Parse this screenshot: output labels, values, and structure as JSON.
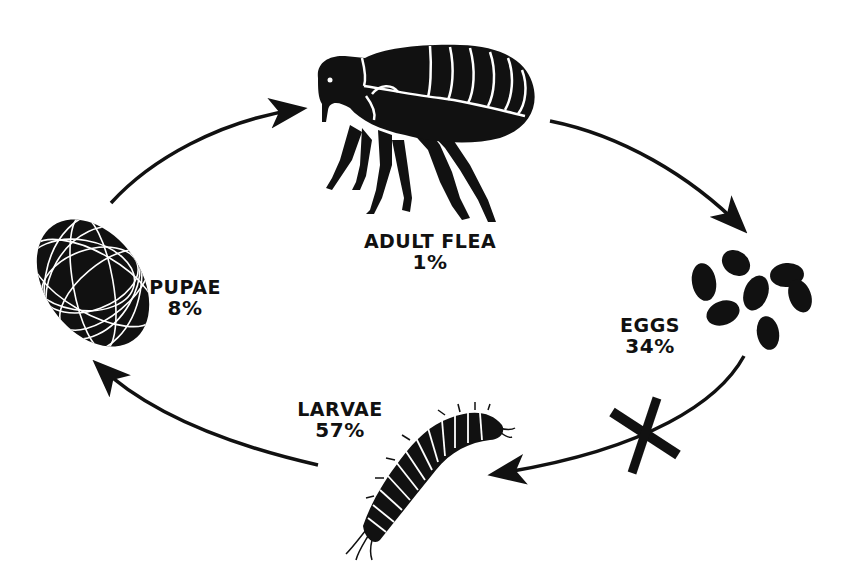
{
  "diagram": {
    "colors": {
      "ink": "#111111",
      "background": "#ffffff"
    },
    "stages": [
      {
        "id": "adult",
        "name": "ADULT FLEA",
        "percent": "1%",
        "icon": "adult-flea-icon"
      },
      {
        "id": "eggs",
        "name": "EGGS",
        "percent": "34%",
        "icon": "eggs-icon"
      },
      {
        "id": "larvae",
        "name": "LARVAE",
        "percent": "57%",
        "icon": "larva-icon"
      },
      {
        "id": "pupae",
        "name": "PUPAE",
        "percent": "8%",
        "icon": "pupa-cocoon-icon"
      }
    ],
    "arrows": [
      {
        "from": "pupae",
        "to": "adult"
      },
      {
        "from": "adult",
        "to": "eggs"
      },
      {
        "from": "eggs",
        "to": "larvae",
        "marker": "x-mark-icon"
      },
      {
        "from": "larvae",
        "to": "pupae"
      }
    ]
  }
}
